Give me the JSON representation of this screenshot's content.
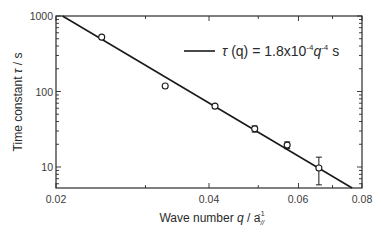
{
  "chart_data": {
    "type": "scatter",
    "title": "",
    "xlabel": "Wave number q / a_//^-1",
    "ylabel": "Time constant τ / s",
    "xscale": "log",
    "yscale": "log",
    "xlim": [
      0.02,
      0.08
    ],
    "ylim": [
      5.3,
      1000
    ],
    "x_ticks": [
      "0.02",
      "0.04",
      "0.06",
      "0.08"
    ],
    "y_ticks": [
      "1000",
      "100",
      "10"
    ],
    "grid": false,
    "legend_position": "upper right",
    "series": [
      {
        "name": "data",
        "marker": "open-circle",
        "x": [
          0.0246,
          0.0328,
          0.0411,
          0.0492,
          0.057,
          0.0658
        ],
        "y": [
          525,
          118,
          64,
          32,
          19.5,
          9.7
        ],
        "error_low": [
          null,
          null,
          null,
          29,
          17.5,
          5.8
        ],
        "error_high": [
          null,
          null,
          null,
          35,
          21.5,
          13.5
        ]
      },
      {
        "name": "τ(q) = 1.8x10^-4 q^-4 s",
        "type": "line",
        "function": "tau = 1.8e-4 * q^-4",
        "x": [
          0.0206,
          0.0765
        ],
        "y": [
          1000,
          5.27
        ]
      }
    ]
  },
  "labels": {
    "x_tick_0": "0.02",
    "x_tick_1": "0.04",
    "x_tick_2": "0.06",
    "x_tick_3": "0.08",
    "y_tick_0": "1000",
    "y_tick_1": "100",
    "y_tick_2": "10",
    "xlabel_main": "Wave number ",
    "xlabel_q": "q",
    "xlabel_slash": " / a",
    "xlabel_sub": "//",
    "xlabel_sup": "-1",
    "ylabel_main": "Time constant ",
    "ylabel_tau": "τ",
    "ylabel_unit": " / s",
    "legend_tau": "τ",
    "legend_q_paren": " (q)",
    "legend_eq": " = 1.8x10",
    "legend_exp1": "-4",
    "legend_q": "q",
    "legend_exp2": "-4",
    "legend_unit": " s"
  },
  "colors": {
    "axis": "#2a2a2a",
    "line": "#1a1a1a",
    "marker": "#1a1a1a"
  }
}
